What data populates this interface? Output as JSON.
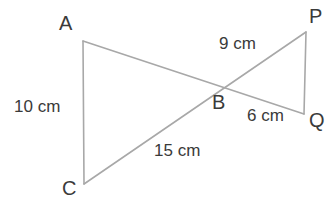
{
  "diagram": {
    "type": "two-triangles-vertical-angles",
    "background_color": "#ffffff",
    "line_color": "#a8a8a8",
    "text_color": "#3a3a3a",
    "vertices": [
      {
        "name": "A",
        "label": "A",
        "x": 83,
        "y": 41
      },
      {
        "name": "C",
        "label": "C",
        "x": 84,
        "y": 184
      },
      {
        "name": "B",
        "label": "B",
        "x": 222,
        "y": 85
      },
      {
        "name": "P",
        "label": "P",
        "x": 306,
        "y": 32
      },
      {
        "name": "Q",
        "label": "Q",
        "x": 304,
        "y": 114
      }
    ],
    "segments": [
      {
        "name": "AC",
        "from": "A",
        "to": "C"
      },
      {
        "name": "AQ",
        "from": "A",
        "to": "Q"
      },
      {
        "name": "CP",
        "from": "C",
        "to": "P"
      },
      {
        "name": "PQ",
        "from": "P",
        "to": "Q"
      }
    ],
    "measurements": [
      {
        "name": "AC",
        "label": "10 cm",
        "value": 10,
        "unit": "cm"
      },
      {
        "name": "BP",
        "label": "9 cm",
        "value": 9,
        "unit": "cm"
      },
      {
        "name": "BQ",
        "label": "6 cm",
        "value": 6,
        "unit": "cm"
      },
      {
        "name": "CB",
        "label": "15 cm",
        "value": 15,
        "unit": "cm"
      }
    ]
  }
}
